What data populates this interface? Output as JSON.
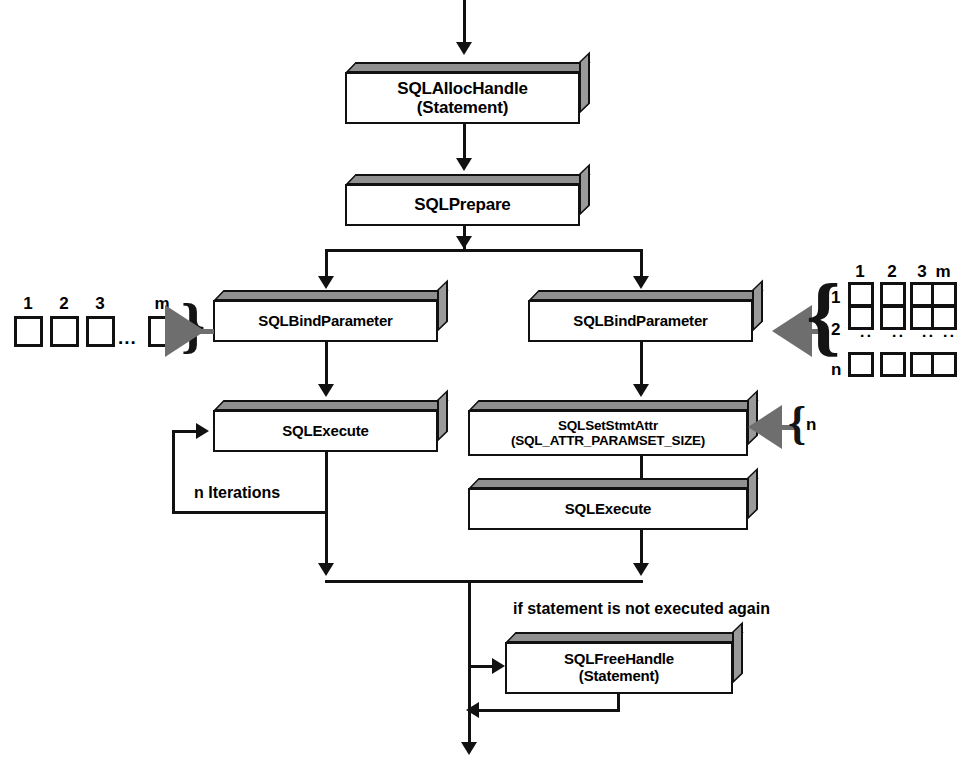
{
  "diagram": {
    "boxes": {
      "alloc": {
        "line1": "SQLAllocHandle",
        "line2": "(Statement)"
      },
      "prepare": {
        "line1": "SQLPrepare"
      },
      "bind_left": {
        "line1": "SQLBindParameter"
      },
      "bind_right": {
        "line1": "SQLBindParameter"
      },
      "execute_left": {
        "line1": "SQLExecute"
      },
      "setstmtattr": {
        "line1": "SQLSetStmtAttr",
        "line2": "(SQL_ATTR_PARAMSET_SIZE)"
      },
      "execute_right": {
        "line1": "SQLExecute"
      },
      "free": {
        "line1": "SQLFreeHandle",
        "line2": "(Statement)"
      }
    },
    "labels": {
      "iterations": "n Iterations",
      "not_executed_again": "if statement is not executed again",
      "paramset_count": "n"
    },
    "left_array": {
      "headers": [
        "1",
        "2",
        "3",
        "m"
      ],
      "ellipsis": "..."
    },
    "right_array": {
      "col_headers": [
        "1",
        "2",
        "3",
        "m"
      ],
      "row_headers": [
        "1",
        "2",
        "n"
      ],
      "h_ellipsis": "...",
      "v_ellipsis": ":"
    },
    "colors": {
      "line": "#111111",
      "box_top": "#909090",
      "box_side": "#9a9a9a",
      "gray_arrow": "#6e6e6e",
      "background": "#ffffff"
    }
  }
}
